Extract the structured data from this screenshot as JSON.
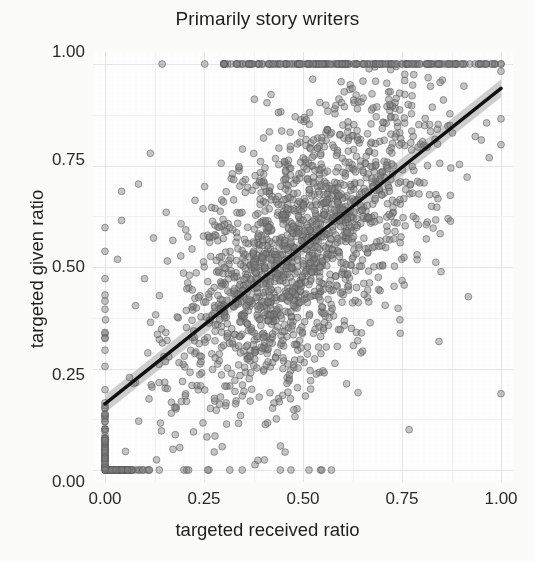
{
  "chart_data": {
    "type": "scatter",
    "title": "Primarily story writers",
    "xlabel": "targeted received ratio",
    "ylabel": "targeted given ratio",
    "xlim": [
      0.0,
      1.0
    ],
    "ylim": [
      0.0,
      1.0
    ],
    "xticks": [
      "0.00",
      "0.25",
      "0.50",
      "0.75",
      "1.00"
    ],
    "xtick_values": [
      0.0,
      0.25,
      0.5,
      0.75,
      1.0
    ],
    "yticks": [
      "0.00",
      "0.25",
      "0.50",
      "0.75",
      "1.00"
    ],
    "ytick_values": [
      0.0,
      0.25,
      0.5,
      0.75,
      1.0
    ],
    "grid": true,
    "grid_major": true,
    "grid_minor": true,
    "legend": "none",
    "point_color": "#808080",
    "point_outline_color": "#5a5a5a",
    "point_opacity": 0.45,
    "point_radius_px": 3.4,
    "line_color": "#111111",
    "ribbon_color": "#bdbdbd",
    "background_color": "#fefefe",
    "gridline_color": "#e6e6e4",
    "fit": {
      "type": "linear-smooth",
      "label": "lm fit with 95% confidence ribbon",
      "intercept": 0.163,
      "slope": 0.777,
      "x_start": 0.0,
      "x_end": 1.0,
      "y_start": 0.163,
      "y_end": 0.94,
      "ribbon_half_width": 0.022
    },
    "n_points": 2100,
    "notes": [
      "Dense cloud centered near (0.50, 0.60)",
      "Saturated row of points along y = 1.00 spanning x ≈ 0.33 to 1.00",
      "Saturated row of points along y = 0.00 spanning x ≈ 0.00 to 0.12",
      "Vertical stack of points along x = 0.00 spanning y ≈ 0.00 to 0.20",
      "Positive correlation; points semi-transparent gray open circles"
    ]
  }
}
